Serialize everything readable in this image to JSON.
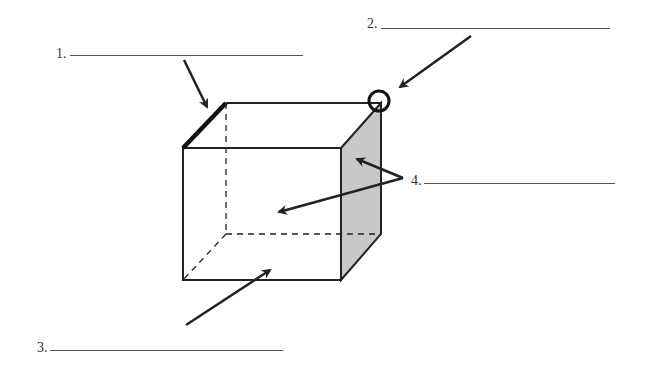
{
  "diagram": {
    "labels": [
      {
        "number": "1.",
        "target": "edge"
      },
      {
        "number": "2.",
        "target": "vertex"
      },
      {
        "number": "3.",
        "target": "base edge"
      },
      {
        "number": "4.",
        "target": "faces"
      }
    ],
    "colors": {
      "stroke": "#222222",
      "shaded_face": "#c8c8c8",
      "background": "#ffffff"
    }
  }
}
